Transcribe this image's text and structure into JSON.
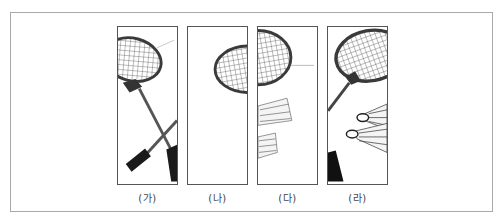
{
  "figure": {
    "panels": [
      {
        "id": "ga",
        "label": "(가)",
        "content": "two crossed badminton rackets, cropped on the left"
      },
      {
        "id": "na",
        "label": "(나)",
        "content": "racket head cropped at the top right, mostly empty"
      },
      {
        "id": "da",
        "label": "(다)",
        "content": "racket head at top left with two shuttlecocks below"
      },
      {
        "id": "ra",
        "label": "(라)",
        "content": "racket head with handle and two shuttlecocks"
      }
    ],
    "colors": {
      "frame": "#555555",
      "outer_border": "#a9a9a9",
      "racket": "#3a3a3a",
      "string": "#555555",
      "grip": "#1a1a1a",
      "caption": "#444444"
    }
  }
}
